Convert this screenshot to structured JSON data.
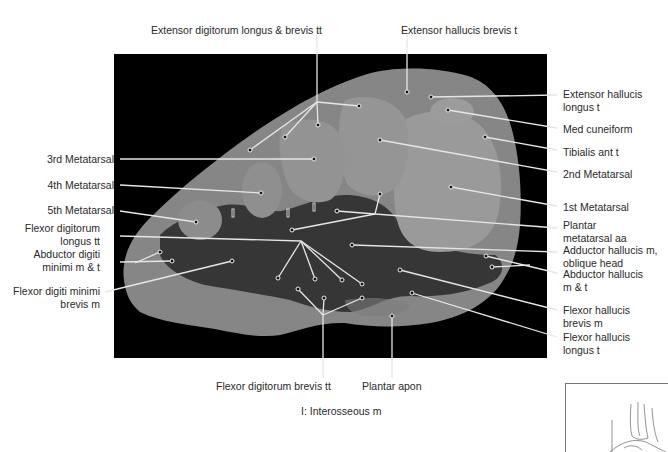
{
  "figure": {
    "top_labels": [
      {
        "id": "edl",
        "text": "Extensor digitorum longus & brevis tt",
        "x": 233,
        "y": 24
      },
      {
        "id": "ehb",
        "text": "Extensor hallucis brevis t",
        "x": 401,
        "y": 24
      }
    ],
    "left_labels": [
      {
        "id": "met3",
        "lines": [
          "3rd Metatarsal"
        ],
        "right": 117,
        "y": 153
      },
      {
        "id": "met4",
        "lines": [
          "4th Metatarsal"
        ],
        "right": 117,
        "y": 179
      },
      {
        "id": "met5",
        "lines": [
          "5th Metatarsal"
        ],
        "right": 117,
        "y": 204
      },
      {
        "id": "fdl",
        "lines": [
          "Flexor digitorum",
          "longus tt"
        ],
        "right": 117,
        "y": 222
      },
      {
        "id": "adm",
        "lines": [
          "Abductor digiti",
          "minimi m & t"
        ],
        "right": 117,
        "y": 248
      },
      {
        "id": "fdmb",
        "lines": [
          "Flexor digiti minimi",
          "brevis m"
        ],
        "right": 117,
        "y": 285
      }
    ],
    "right_labels": [
      {
        "id": "ehl",
        "lines": [
          "Extensor hallucis",
          "longus t"
        ],
        "x": 563,
        "y": 88
      },
      {
        "id": "medcun",
        "lines": [
          "Med cuneiform"
        ],
        "x": 563,
        "y": 123
      },
      {
        "id": "tibant",
        "lines": [
          "Tibialis ant t"
        ],
        "x": 563,
        "y": 146
      },
      {
        "id": "met2",
        "lines": [
          "2nd Metatarsal"
        ],
        "x": 563,
        "y": 168
      },
      {
        "id": "met1",
        "lines": [
          "1st Metatarsal"
        ],
        "x": 563,
        "y": 201
      },
      {
        "id": "pma",
        "lines": [
          "Plantar",
          "metatarsal aa"
        ],
        "x": 563,
        "y": 219
      },
      {
        "id": "addh",
        "lines": [
          "Adductor hallucis m,",
          "oblique head"
        ],
        "x": 563,
        "y": 244
      },
      {
        "id": "abdh",
        "lines": [
          "Abductor hallucis",
          "m & t"
        ],
        "x": 563,
        "y": 268
      },
      {
        "id": "fhb",
        "lines": [
          "Flexor hallucis",
          "brevis m"
        ],
        "x": 563,
        "y": 304
      },
      {
        "id": "fhl",
        "lines": [
          "Flexor hallucis",
          "longus t"
        ],
        "x": 563,
        "y": 331
      }
    ],
    "bottom_labels": [
      {
        "id": "fdb",
        "text": "Flexor digitorum brevis tt",
        "x": 272,
        "y": 380
      },
      {
        "id": "plapon",
        "text": "Plantar apon",
        "x": 392,
        "y": 380
      }
    ],
    "legend": {
      "text": "I: Interosseous m",
      "x": 324,
      "y": 405
    },
    "interosseous_marker": "I",
    "colors": {
      "background": "#ffffff",
      "photo_bg": "#000000",
      "tissue_light": "#8d8d8d",
      "tissue_mid": "#6e6e6e",
      "tissue_dark": "#2a2a2a",
      "leader": "#e8e8e8",
      "text": "#2a2a2a"
    }
  }
}
